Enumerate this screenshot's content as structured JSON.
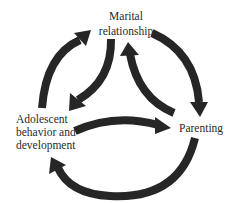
{
  "nodes": {
    "marital": {
      "lines": [
        "Marital",
        "relationship"
      ]
    },
    "adolescent": {
      "lines": [
        "Adolescent",
        "behavior and",
        "development"
      ]
    },
    "parenting": {
      "lines": [
        "Parenting"
      ]
    }
  },
  "edges": [
    {
      "from": "Adolescent behavior and development",
      "to": "Marital relationship"
    },
    {
      "from": "Marital relationship",
      "to": "Adolescent behavior and development"
    },
    {
      "from": "Parenting",
      "to": "Marital relationship"
    },
    {
      "from": "Marital relationship",
      "to": "Parenting"
    },
    {
      "from": "Adolescent behavior and development",
      "to": "Parenting"
    },
    {
      "from": "Parenting",
      "to": "Adolescent behavior and development"
    }
  ],
  "colors": {
    "arrow": "#262626",
    "text": "#2a2a2a",
    "background": "#ffffff"
  }
}
